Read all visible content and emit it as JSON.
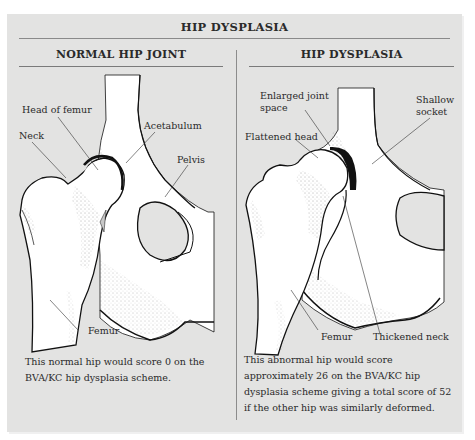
{
  "title": "HIP DYSPLASIA",
  "panels": {
    "left": {
      "heading": "NORMAL HIP JOINT",
      "labels": {
        "head_of_femur": "Head of femur",
        "neck": "Neck",
        "acetabulum": "Acetabulum",
        "pelvis": "Pelvis",
        "femur": "Femur"
      },
      "caption": "This normal hip would score 0 on the BVA/KC hip dysplasia scheme."
    },
    "right": {
      "heading": "HIP DYSPLASIA",
      "labels": {
        "enlarged_joint_space": "Enlarged joint\nspace",
        "shallow_socket": "Shallow\nsocket",
        "flattened_head": "Flattened head",
        "femur": "Femur",
        "thickened_neck": "Thickened neck"
      },
      "caption": "This abnormal hip would score approximately 26 on the BVA/KC hip dysplasia scheme giving a total score of 52 if the other hip was similarly deformed."
    }
  },
  "colors": {
    "panel_bg": "#e3e3e2",
    "bone_fill": "#ffffff",
    "outline": "#111111",
    "rule": "#8a8a8a"
  }
}
